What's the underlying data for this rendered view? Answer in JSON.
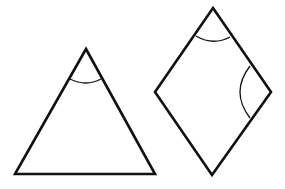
{
  "diagram": {
    "width": 285,
    "height": 189,
    "background": "#ffffff",
    "stroke_color": "#111111",
    "shapes": [
      {
        "id": "triangle",
        "type": "isosceles-triangle",
        "vertices": [
          [
            86,
            49
          ],
          [
            155,
            174
          ],
          [
            15,
            174
          ]
        ],
        "angle_marks": [
          {
            "vertex": "apex",
            "path": "M70 79 Q86 87 101 79"
          }
        ]
      },
      {
        "id": "rhombus",
        "type": "rhombus",
        "vertices": [
          [
            213,
            8
          ],
          [
            271,
            92
          ],
          [
            212,
            175
          ],
          [
            155,
            92
          ]
        ],
        "angle_marks": [
          {
            "vertex": "top",
            "path": "M196 36 Q213 46 230 37"
          },
          {
            "vertex": "right",
            "path": "M250 66 Q230 92 250 118"
          }
        ]
      }
    ]
  }
}
